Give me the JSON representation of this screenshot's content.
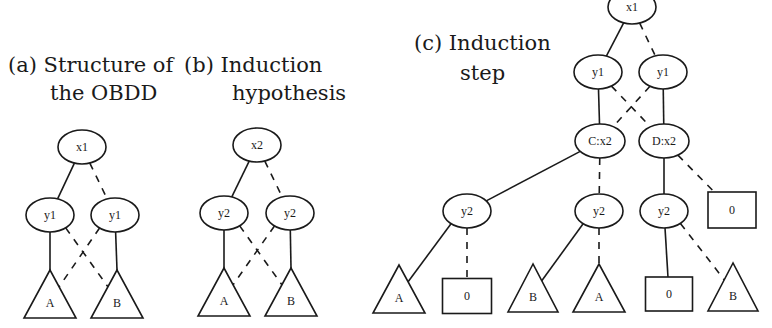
{
  "panels": [
    {
      "id": "a",
      "caption_line1": "(a) Structure of",
      "caption_line2": "the OBDD",
      "nodes": [
        {
          "id": "a_x1",
          "type": "ellipse",
          "label": "x1"
        },
        {
          "id": "a_y1L",
          "type": "ellipse",
          "label": "y1"
        },
        {
          "id": "a_y1R",
          "type": "ellipse",
          "label": "y1"
        },
        {
          "id": "a_A",
          "type": "triangle",
          "label": "A"
        },
        {
          "id": "a_B",
          "type": "triangle",
          "label": "B"
        }
      ],
      "edges": [
        {
          "from": "a_x1",
          "to": "a_y1L",
          "style": "solid"
        },
        {
          "from": "a_x1",
          "to": "a_y1R",
          "style": "dashed"
        },
        {
          "from": "a_y1L",
          "to": "a_A",
          "style": "solid"
        },
        {
          "from": "a_y1L",
          "to": "a_B",
          "style": "dashed"
        },
        {
          "from": "a_y1R",
          "to": "a_B",
          "style": "solid"
        },
        {
          "from": "a_y1R",
          "to": "a_A",
          "style": "dashed"
        }
      ]
    },
    {
      "id": "b",
      "caption_line1": "(b) Induction",
      "caption_line2": "hypothesis",
      "nodes": [
        {
          "id": "b_x2",
          "type": "ellipse",
          "label": "x2"
        },
        {
          "id": "b_y2L",
          "type": "ellipse",
          "label": "y2"
        },
        {
          "id": "b_y2R",
          "type": "ellipse",
          "label": "y2"
        },
        {
          "id": "b_A",
          "type": "triangle",
          "label": "A"
        },
        {
          "id": "b_B",
          "type": "triangle",
          "label": "B"
        }
      ],
      "edges": [
        {
          "from": "b_x2",
          "to": "b_y2L",
          "style": "solid"
        },
        {
          "from": "b_x2",
          "to": "b_y2R",
          "style": "dashed"
        },
        {
          "from": "b_y2L",
          "to": "b_A",
          "style": "solid"
        },
        {
          "from": "b_y2L",
          "to": "b_B",
          "style": "dashed"
        },
        {
          "from": "b_y2R",
          "to": "b_B",
          "style": "solid"
        },
        {
          "from": "b_y2R",
          "to": "b_A",
          "style": "dashed"
        }
      ]
    },
    {
      "id": "c",
      "caption_line1": "(c) Induction",
      "caption_line2": "step",
      "nodes": [
        {
          "id": "c_x1",
          "type": "ellipse",
          "label": "x1"
        },
        {
          "id": "c_y1L",
          "type": "ellipse",
          "label": "y1"
        },
        {
          "id": "c_y1R",
          "type": "ellipse",
          "label": "y1"
        },
        {
          "id": "c_C",
          "type": "ellipse",
          "label": "C:x2"
        },
        {
          "id": "c_D",
          "type": "ellipse",
          "label": "D:x2"
        },
        {
          "id": "c_y2a",
          "type": "ellipse",
          "label": "y2"
        },
        {
          "id": "c_y2b",
          "type": "ellipse",
          "label": "y2"
        },
        {
          "id": "c_y2c",
          "type": "ellipse",
          "label": "y2"
        },
        {
          "id": "c_0top",
          "type": "box",
          "label": "0"
        },
        {
          "id": "c_A1",
          "type": "triangle",
          "label": "A"
        },
        {
          "id": "c_01",
          "type": "box",
          "label": "0"
        },
        {
          "id": "c_B1",
          "type": "triangle",
          "label": "B"
        },
        {
          "id": "c_A2",
          "type": "triangle",
          "label": "A"
        },
        {
          "id": "c_02",
          "type": "box",
          "label": "0"
        },
        {
          "id": "c_B2",
          "type": "triangle",
          "label": "B"
        }
      ],
      "edges": [
        {
          "from": "c_x1",
          "to": "c_y1L",
          "style": "solid"
        },
        {
          "from": "c_x1",
          "to": "c_y1R",
          "style": "dashed"
        },
        {
          "from": "c_y1L",
          "to": "c_C",
          "style": "solid"
        },
        {
          "from": "c_y1L",
          "to": "c_D",
          "style": "dashed"
        },
        {
          "from": "c_y1R",
          "to": "c_D",
          "style": "solid"
        },
        {
          "from": "c_y1R",
          "to": "c_C",
          "style": "dashed"
        },
        {
          "from": "c_C",
          "to": "c_y2a",
          "style": "solid"
        },
        {
          "from": "c_C",
          "to": "c_y2b",
          "style": "dashed"
        },
        {
          "from": "c_D",
          "to": "c_y2c",
          "style": "solid"
        },
        {
          "from": "c_D",
          "to": "c_0top",
          "style": "dashed"
        },
        {
          "from": "c_y2a",
          "to": "c_A1",
          "style": "solid"
        },
        {
          "from": "c_y2a",
          "to": "c_01",
          "style": "dashed"
        },
        {
          "from": "c_y2b",
          "to": "c_B1",
          "style": "solid"
        },
        {
          "from": "c_y2b",
          "to": "c_A2",
          "style": "dashed"
        },
        {
          "from": "c_y2c",
          "to": "c_02",
          "style": "solid"
        },
        {
          "from": "c_y2c",
          "to": "c_B2",
          "style": "dashed"
        }
      ]
    }
  ]
}
